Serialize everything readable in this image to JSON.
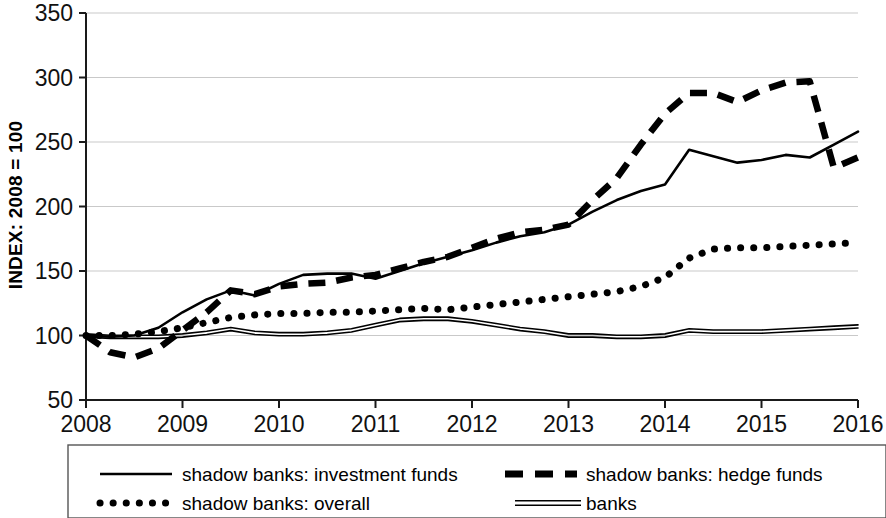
{
  "chart_data": {
    "type": "line",
    "title": "",
    "subtitle": "",
    "xlabel": "",
    "ylabel": "INDEX: 2008 = 100",
    "xlim": [
      2008,
      2016
    ],
    "ylim": [
      50,
      350
    ],
    "grid": true,
    "grid_axis": "y",
    "legend_position": "bottom",
    "x_ticks": [
      "2008",
      "2009",
      "2010",
      "2011",
      "2012",
      "2013",
      "2014",
      "2015",
      "2016"
    ],
    "x_tick_values": [
      2008,
      2009,
      2010,
      2011,
      2012,
      2013,
      2014,
      2015,
      2016
    ],
    "y_ticks": [
      "50",
      "100",
      "150",
      "200",
      "250",
      "300",
      "350"
    ],
    "y_tick_values": [
      50,
      100,
      150,
      200,
      250,
      300,
      350
    ],
    "series": [
      {
        "name": "shadow banks: investment funds",
        "style": "solid",
        "color": "#000000",
        "width": 2.6,
        "x": [
          2008.0,
          2008.25,
          2008.5,
          2008.75,
          2009.0,
          2009.25,
          2009.5,
          2009.75,
          2010.0,
          2010.25,
          2010.5,
          2010.75,
          2011.0,
          2011.25,
          2011.5,
          2011.75,
          2012.0,
          2012.25,
          2012.5,
          2012.75,
          2013.0,
          2013.25,
          2013.5,
          2013.75,
          2014.0,
          2014.25,
          2014.5,
          2014.75,
          2015.0,
          2015.25,
          2015.5,
          2015.75,
          2016.0
        ],
        "values": [
          100,
          99,
          100,
          106,
          118,
          128,
          135,
          131,
          140,
          147,
          148,
          148,
          144,
          150,
          156,
          161,
          166,
          172,
          177,
          180,
          186,
          196,
          205,
          212,
          217,
          244,
          239,
          234,
          236,
          240,
          238,
          248,
          258
        ]
      },
      {
        "name": "shadow banks: hedge funds",
        "style": "dashed",
        "color": "#000000",
        "width": 6.5,
        "dash": "17,11",
        "x": [
          2008.0,
          2008.25,
          2008.5,
          2008.75,
          2009.0,
          2009.25,
          2009.5,
          2009.75,
          2010.0,
          2010.25,
          2010.5,
          2010.75,
          2011.0,
          2011.25,
          2011.5,
          2011.75,
          2012.0,
          2012.25,
          2012.5,
          2012.75,
          2013.0,
          2013.25,
          2013.5,
          2013.75,
          2014.0,
          2014.25,
          2014.5,
          2014.75,
          2015.0,
          2015.25,
          2015.5,
          2015.75,
          2016.0
        ],
        "values": [
          100,
          87,
          83,
          90,
          104,
          118,
          135,
          132,
          138,
          140,
          141,
          145,
          147,
          152,
          157,
          161,
          168,
          175,
          180,
          182,
          186,
          205,
          222,
          248,
          272,
          288,
          288,
          281,
          290,
          296,
          297,
          230,
          238
        ]
      },
      {
        "name": "shadow banks: overall",
        "style": "dotted",
        "color": "#000000",
        "width": 7,
        "dash": "0.1,13",
        "x": [
          2008.0,
          2008.25,
          2008.5,
          2008.75,
          2009.0,
          2009.25,
          2009.5,
          2009.75,
          2010.0,
          2010.25,
          2010.5,
          2010.75,
          2011.0,
          2011.25,
          2011.5,
          2011.75,
          2012.0,
          2012.25,
          2012.5,
          2012.75,
          2013.0,
          2013.25,
          2013.5,
          2013.75,
          2014.0,
          2014.25,
          2014.5,
          2014.75,
          2015.0,
          2015.25,
          2015.5,
          2015.75,
          2016.0
        ],
        "values": [
          100,
          100,
          101,
          103,
          106,
          110,
          114,
          116,
          117,
          117,
          118,
          118,
          119,
          120,
          121,
          120,
          122,
          124,
          126,
          128,
          130,
          132,
          134,
          138,
          145,
          160,
          167,
          168,
          168,
          169,
          170,
          171,
          172
        ]
      },
      {
        "name": "banks",
        "style": "double",
        "color": "#000000",
        "width": 1.6,
        "offset": 3.2,
        "x": [
          2008.0,
          2008.25,
          2008.5,
          2008.75,
          2009.0,
          2009.25,
          2009.5,
          2009.75,
          2010.0,
          2010.25,
          2010.5,
          2010.75,
          2011.0,
          2011.25,
          2011.5,
          2011.75,
          2012.0,
          2012.25,
          2012.5,
          2012.75,
          2013.0,
          2013.25,
          2013.5,
          2013.75,
          2014.0,
          2014.25,
          2014.5,
          2014.75,
          2015.0,
          2015.25,
          2015.5,
          2015.75,
          2016.0
        ],
        "values": [
          100,
          99,
          99,
          99,
          100,
          102,
          105,
          102,
          101,
          101,
          102,
          104,
          108,
          112,
          113,
          113,
          111,
          108,
          105,
          103,
          100,
          100,
          99,
          99,
          100,
          104,
          103,
          103,
          103,
          104,
          105,
          106,
          107
        ]
      }
    ]
  },
  "axis": {
    "ylabel": "INDEX: 2008 = 100"
  },
  "legend": {
    "entries": [
      {
        "label": "shadow banks: investment funds",
        "marker": "solid-line-marker"
      },
      {
        "label": "shadow banks: hedge funds",
        "marker": "dashed-line-marker"
      },
      {
        "label": "shadow banks: overall",
        "marker": "dotted-line-marker"
      },
      {
        "label": "banks",
        "marker": "double-line-marker"
      }
    ]
  }
}
